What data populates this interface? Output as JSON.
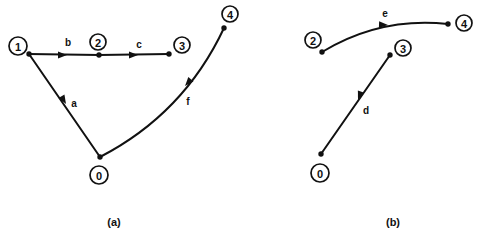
{
  "figure": {
    "width": 477,
    "height": 239,
    "background": "#ffffff",
    "ink_color": "#111111"
  },
  "panels": [
    {
      "id": "a",
      "caption": "(a)",
      "caption_x": 114,
      "caption_y": 222,
      "nodes": [
        {
          "label": "1",
          "cx": 18,
          "cy": 46,
          "r": 9,
          "dot_x": 29,
          "dot_y": 54
        },
        {
          "label": "2",
          "cx": 98,
          "cy": 42,
          "r": 8,
          "dot_x": 99,
          "dot_y": 55
        },
        {
          "label": "3",
          "cx": 182,
          "cy": 45,
          "r": 8,
          "dot_x": 169,
          "dot_y": 54
        },
        {
          "label": "4",
          "cx": 230,
          "cy": 14,
          "r": 8,
          "dot_x": 224,
          "dot_y": 28
        },
        {
          "label": "0",
          "cx": 99,
          "cy": 175,
          "r": 9,
          "dot_x": 100,
          "dot_y": 157
        }
      ],
      "edges": [
        {
          "label": "b",
          "from": "1",
          "to": "2",
          "label_x": 68,
          "label_y": 42,
          "arrow_x": 67,
          "arrow_y": 55,
          "arrow_angle": 0,
          "curve": "straight"
        },
        {
          "label": "c",
          "from": "2",
          "to": "3",
          "label_x": 139,
          "label_y": 44,
          "arrow_x": 138,
          "arrow_y": 55,
          "arrow_angle": 0,
          "curve": "straight"
        },
        {
          "label": "a",
          "from": "1",
          "to": "0",
          "label_x": 74,
          "label_y": 103,
          "arrow_x": 66,
          "arrow_y": 104,
          "arrow_angle": 60,
          "curve": "straight"
        },
        {
          "label": "f",
          "from": "4",
          "to": "0",
          "label_x": 188,
          "label_y": 101,
          "arrow_x": 185,
          "arrow_y": 86,
          "arrow_angle": 131,
          "curve": "arc"
        }
      ]
    },
    {
      "id": "b",
      "caption": "(b)",
      "caption_x": 393,
      "caption_y": 222,
      "nodes": [
        {
          "label": "2",
          "cx": 313,
          "cy": 40,
          "r": 8,
          "dot_x": 322,
          "dot_y": 52
        },
        {
          "label": "4",
          "cx": 464,
          "cy": 23,
          "r": 8,
          "dot_x": 448,
          "dot_y": 24
        },
        {
          "label": "3",
          "cx": 403,
          "cy": 48,
          "r": 8,
          "dot_x": 390,
          "dot_y": 55
        },
        {
          "label": "0",
          "cx": 320,
          "cy": 173,
          "r": 9,
          "dot_x": 321,
          "dot_y": 154
        }
      ],
      "edges": [
        {
          "label": "e",
          "from": "2",
          "to": "4",
          "label_x": 385,
          "label_y": 13,
          "arrow_x": 388,
          "arrow_y": 25,
          "arrow_angle": 2,
          "curve": "arc"
        },
        {
          "label": "d",
          "from": "3",
          "to": "0",
          "label_x": 366,
          "label_y": 110,
          "arrow_x": 358,
          "arrow_y": 100,
          "arrow_angle": 110,
          "curve": "straight"
        }
      ]
    }
  ]
}
